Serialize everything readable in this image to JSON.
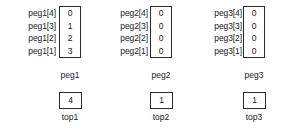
{
  "diagram": {
    "title": "Towers of Hanoi peg array state",
    "pegs": [
      {
        "name": "peg1",
        "caption": "peg1",
        "index_labels": [
          "peg1[4]",
          "peg1[3]",
          "peg1[2]",
          "peg1[1]"
        ],
        "values": [
          "0",
          "1",
          "2",
          "3"
        ],
        "top_value": "4",
        "top_caption": "top1"
      },
      {
        "name": "peg2",
        "caption": "peg2",
        "index_labels": [
          "peg2[4]",
          "peg2[3]",
          "peg2[2]",
          "peg2[1]"
        ],
        "values": [
          "0",
          "0",
          "0",
          "0"
        ],
        "top_value": "1",
        "top_caption": "top2"
      },
      {
        "name": "peg3",
        "caption": "peg3",
        "index_labels": [
          "peg3[4]",
          "peg3[3]",
          "peg3[2]",
          "peg3[1]"
        ],
        "values": [
          "0",
          "0",
          "0",
          "0"
        ],
        "top_value": "1",
        "top_caption": "top3"
      }
    ],
    "colors": {
      "background": "#ffffff",
      "border": "#2b2b2b",
      "text": "#1a1a1a"
    }
  }
}
